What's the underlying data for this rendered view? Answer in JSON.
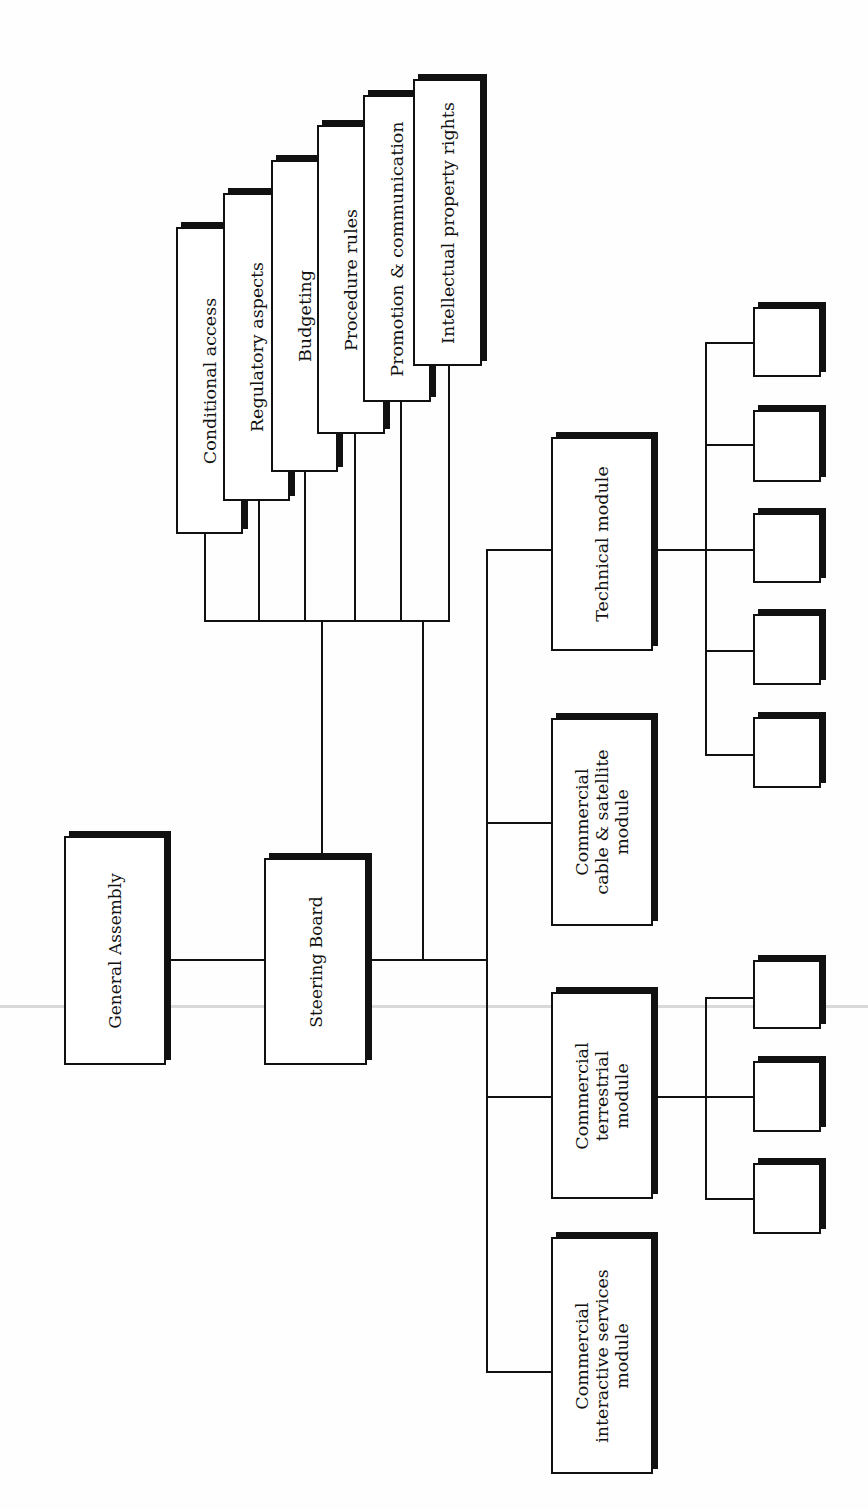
{
  "diagram": {
    "type": "organization-chart",
    "orientation": "rotated-90-ccw",
    "nodes": {
      "general_assembly": "General Assembly",
      "steering_board": "Steering Board",
      "committees": [
        "Conditional access",
        "Regulatory aspects",
        "Budgeting",
        "Procedure rules",
        "Promotion & communication",
        "Intellectual property rights"
      ],
      "modules": {
        "technical": "Technical module",
        "cable_satellite": "Commercial\ncable & satellite\nmodule",
        "terrestrial": "Commercial\nterrestrial\nmodule",
        "interactive": "Commercial\ninteractive services\nmodule"
      },
      "technical_subgroups_count": 5,
      "terrestrial_subgroups_count": 3
    },
    "edges": [
      [
        "General Assembly",
        "Steering Board"
      ],
      [
        "Steering Board",
        "Conditional access"
      ],
      [
        "Steering Board",
        "Regulatory aspects"
      ],
      [
        "Steering Board",
        "Budgeting"
      ],
      [
        "Steering Board",
        "Procedure rules"
      ],
      [
        "Steering Board",
        "Promotion & communication"
      ],
      [
        "Steering Board",
        "Intellectual property rights"
      ],
      [
        "Steering Board",
        "Technical module"
      ],
      [
        "Steering Board",
        "Commercial cable & satellite module"
      ],
      [
        "Steering Board",
        "Commercial terrestrial module"
      ],
      [
        "Steering Board",
        "Commercial interactive services module"
      ]
    ]
  },
  "colors": {
    "line": "#111111",
    "box_fill": "#ffffff",
    "background": "#fefefe"
  }
}
